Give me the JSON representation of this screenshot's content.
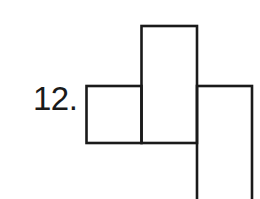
{
  "problem": {
    "number_label": "12."
  },
  "figure": {
    "stroke_color": "#1a1a1a",
    "background_color": "#ffffff",
    "shapes": [
      {
        "name": "left-square",
        "x": 86,
        "y": 86,
        "width": 55,
        "height": 57
      },
      {
        "name": "center-tall-rectangle",
        "x": 141,
        "y": 26,
        "width": 56,
        "height": 117
      },
      {
        "name": "right-rectangle",
        "x": 197,
        "y": 86,
        "width": 55,
        "height": 120
      }
    ]
  }
}
